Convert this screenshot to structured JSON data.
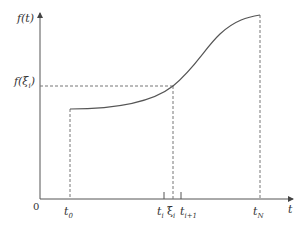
{
  "diagram": {
    "type": "function-plot-riemann-point",
    "y_axis_label": "f(t)",
    "x_axis_label": "t",
    "origin_label": "0",
    "y_marker_label": "f(ξi)",
    "x_tick_labels": [
      "t0",
      "ti",
      "ξi",
      "ti+1",
      "tN"
    ],
    "colors": {
      "line": "#555555",
      "dash": "#777777",
      "text": "#333333"
    },
    "points": {
      "axis_origin": [
        40,
        199
      ],
      "x_axis_end": [
        292,
        199
      ],
      "y_axis_end": [
        40,
        14
      ],
      "curve_start": [
        70,
        109
      ],
      "xi_point": [
        173,
        86
      ],
      "curve_end": [
        260,
        15
      ],
      "t_i": 164,
      "xi_i": 173,
      "t_i1": 181,
      "t_N": 260,
      "t_0": 70
    }
  }
}
